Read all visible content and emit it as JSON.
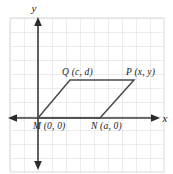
{
  "figure": {
    "kind": "coordinate-plane-parallelogram",
    "background_color": "#ffffff",
    "grid": {
      "visible": true,
      "color": "#d9d9d9",
      "cell_size": 14,
      "left": 10,
      "top": 18,
      "right": 164,
      "bottom": 172
    },
    "axes": {
      "color": "#3a3a3a",
      "x_axis": {
        "label": "x",
        "label_x": 165,
        "label_y": 122,
        "y": 118,
        "x_start": 8,
        "x_end": 159
      },
      "y_axis": {
        "label": "y",
        "label_x": 34,
        "label_y": 12,
        "x": 38,
        "y_start": 20,
        "y_end": 166
      }
    },
    "shape": {
      "name": "parallelogram-MNPQ",
      "stroke_color": "#4a4a4a",
      "vertices": [
        {
          "name": "M",
          "label": "M (0, 0)",
          "x": 38,
          "y": 118,
          "label_x": 33,
          "label_y": 129
        },
        {
          "name": "N",
          "label": "N (a, 0)",
          "x": 100,
          "y": 118,
          "label_x": 91,
          "label_y": 129
        },
        {
          "name": "P",
          "label": "P (x, y)",
          "x": 134,
          "y": 80,
          "label_x": 126,
          "label_y": 75
        },
        {
          "name": "Q",
          "label": "Q (c, d)",
          "x": 70,
          "y": 80,
          "label_x": 62,
          "label_y": 75
        }
      ],
      "path": "38,118 100,118 134,80 70,80"
    }
  }
}
